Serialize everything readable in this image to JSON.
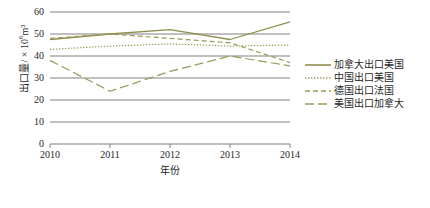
{
  "chart_data": {
    "type": "line",
    "title": "",
    "xlabel": "年份",
    "ylabel": "出口量/ × 10⁶m³",
    "ylabel_main": "出口量/ × 10",
    "ylabel_exp": "6",
    "ylabel_unit": "m³",
    "categories": [
      "2010",
      "2011",
      "2012",
      "2013",
      "2014"
    ],
    "x": [
      2010,
      2011,
      2012,
      2013,
      2014
    ],
    "xlim": [
      2010,
      2014
    ],
    "ylim": [
      0,
      60
    ],
    "yticks": [
      0,
      10,
      20,
      30,
      40,
      50,
      60
    ],
    "ytick_labels": [
      "0",
      "10",
      "20",
      "30",
      "40",
      "50",
      "60"
    ],
    "grid": "horizontal",
    "legend_position": "right",
    "line_color": "#9a9a5a",
    "grid_color": "#808080",
    "series": [
      {
        "name": "加拿大出口美国",
        "style": "solid",
        "color": "#8f8f4e",
        "values": [
          47.5,
          50.0,
          52.0,
          47.5,
          55.5
        ]
      },
      {
        "name": "中国出口美国",
        "style": "dotted",
        "color": "#9a9a5a",
        "values": [
          43.0,
          44.5,
          45.5,
          44.5,
          45.0
        ]
      },
      {
        "name": "德国出口法国",
        "style": "dashed",
        "color": "#9a9a5a",
        "values": [
          48.0,
          50.0,
          48.0,
          46.0,
          37.0
        ]
      },
      {
        "name": "美国出口加拿大",
        "style": "dashdot",
        "color": "#9a9a5a",
        "values": [
          38.0,
          24.0,
          33.0,
          40.0,
          35.5
        ]
      }
    ]
  },
  "legend": {
    "items": [
      {
        "label": "加拿大出口美国",
        "style": "solid"
      },
      {
        "label": "中国出口美国",
        "style": "dotted"
      },
      {
        "label": "德国出口法国",
        "style": "dashed"
      },
      {
        "label": "美国出口加拿大",
        "style": "dashdot"
      }
    ]
  }
}
